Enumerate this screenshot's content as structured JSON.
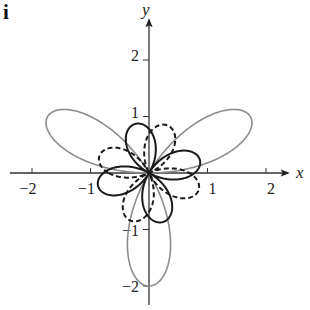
{
  "panel_label": "i",
  "chart_data": {
    "type": "line",
    "subtype": "polar-curves",
    "title": "",
    "xlabel": "x",
    "ylabel": "y",
    "xlim": [
      -2.5,
      2.5
    ],
    "ylim": [
      -2.3,
      2.3
    ],
    "xticks": [
      -2,
      -1,
      1,
      2
    ],
    "yticks": [
      2,
      1,
      -1,
      -2
    ],
    "xtick_labels": [
      "−2",
      "−1",
      "1",
      "2"
    ],
    "ytick_labels": [
      "2",
      "1",
      "−1",
      "−2"
    ],
    "grid": false,
    "legend": null,
    "series": [
      {
        "name": "three-petal rose",
        "equation": "r = 2 sin(3θ)",
        "style": "solid",
        "color": "#8c8c8c",
        "amplitude": 2,
        "k": 3,
        "func": "sin",
        "phase_deg": 0,
        "petal_directions_deg": [
          30,
          150,
          270
        ]
      },
      {
        "name": "four-petal rose (solid)",
        "equation": "r ≈ 0.9 cos(2(θ − 15°))",
        "style": "solid",
        "color": "#1a1a1a",
        "amplitude": 0.9,
        "k": 2,
        "func": "cos",
        "phase_deg": 15,
        "petal_directions_deg": [
          15,
          105,
          195,
          285
        ]
      },
      {
        "name": "four-petal rose (dashed)",
        "equation": "r ≈ 0.9 cos(2(θ − 70°))",
        "style": "dashed",
        "color": "#1a1a1a",
        "amplitude": 0.9,
        "k": 2,
        "func": "cos",
        "phase_deg": 70,
        "petal_directions_deg": [
          70,
          160,
          250,
          340
        ]
      }
    ]
  }
}
